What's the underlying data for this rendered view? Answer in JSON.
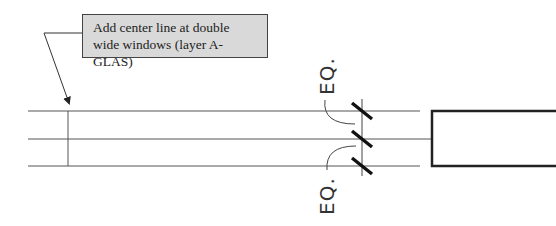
{
  "callout": {
    "text": "Add center line at double wide windows (layer A-GLAS)"
  },
  "dimensions": {
    "upper_label": "EQ.",
    "lower_label": "EQ."
  },
  "colors": {
    "callout_fill": "#d9d9d9",
    "line": "#444444"
  }
}
